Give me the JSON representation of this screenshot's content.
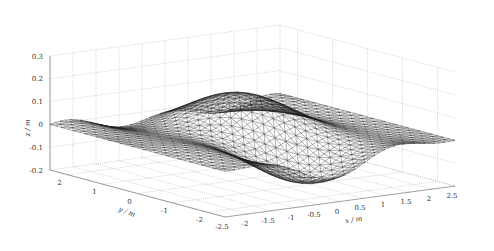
{
  "chart_data": {
    "type": "surface",
    "title": "",
    "xlabel": "x / m",
    "ylabel": "y / m",
    "zlabel": "z / m",
    "xlim": [
      -2.5,
      2.5
    ],
    "ylim": [
      -2.5,
      2.5
    ],
    "zlim": [
      -0.2,
      0.3
    ],
    "x_ticks": [
      "-2.5",
      "-2",
      "-1.5",
      "-1",
      "-0.5",
      "0",
      "0.5",
      "1",
      "1.5",
      "2",
      "2.5"
    ],
    "y_ticks": [
      "2",
      "1",
      "0",
      "-1",
      "-2"
    ],
    "z_ticks": [
      "0.3",
      "0.2",
      "0.1",
      "0",
      "-0.1",
      "-0.2"
    ],
    "grid": true,
    "style": "triangulated wireframe mesh, black edges on white"
  },
  "axes": {
    "z_label": "z / m",
    "y_label": "y / m",
    "x_label": "x / m"
  }
}
